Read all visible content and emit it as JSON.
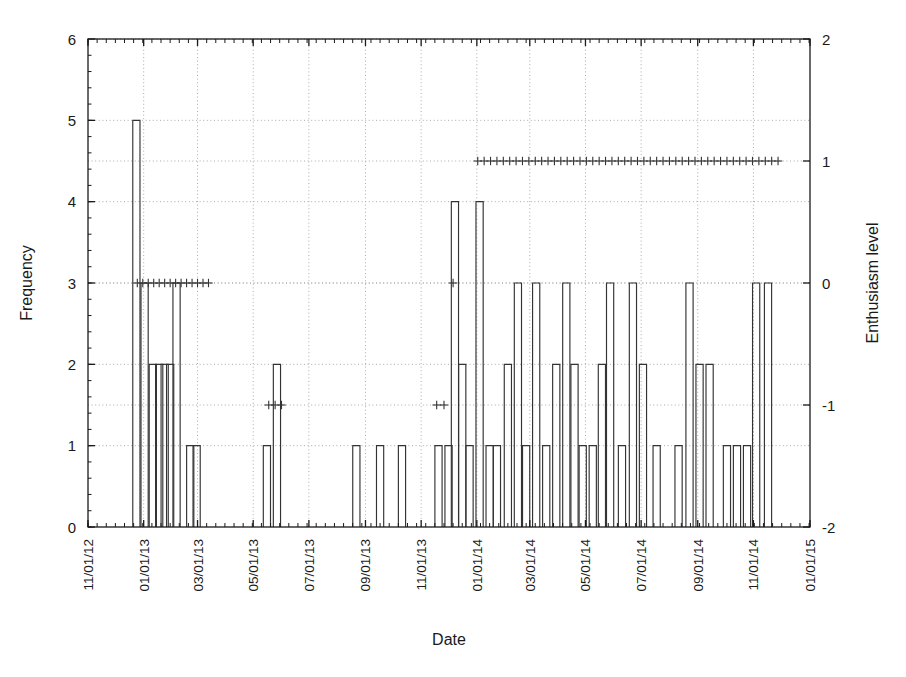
{
  "chart_data": {
    "type": "bar",
    "title": "",
    "xlabel": "Date",
    "ylabel": "Frequency",
    "y2label": "Enthusiasm level",
    "grid": true,
    "legend": null,
    "xlim": [
      "11/01/12",
      "01/01/15"
    ],
    "ylim": [
      0,
      6
    ],
    "y2lim": [
      -2,
      2
    ],
    "ytick_labels": [
      "0",
      "1",
      "2",
      "3",
      "4",
      "5",
      "6"
    ],
    "ytick_values": [
      0,
      1,
      2,
      3,
      4,
      5,
      6
    ],
    "y2tick_labels": [
      "-2",
      "-1",
      "0",
      "1",
      "2"
    ],
    "y2tick_values": [
      -2,
      -1,
      0,
      1,
      2
    ],
    "xtick_labels": [
      "11/01/12",
      "01/01/13",
      "03/01/13",
      "05/01/13",
      "07/01/13",
      "09/01/13",
      "11/01/13",
      "01/01/14",
      "03/01/14",
      "05/01/14",
      "07/01/14",
      "09/01/14",
      "11/01/14",
      "01/01/15"
    ],
    "xtick_positions": [
      0,
      61,
      120,
      181,
      242,
      304,
      365,
      426,
      484,
      545,
      606,
      668,
      729,
      791
    ],
    "x_axis_total_days": 791,
    "bar_series_name": "Frequency",
    "bars": [
      {
        "day": 53,
        "value": 5
      },
      {
        "day": 62,
        "value": 3
      },
      {
        "day": 71,
        "value": 2
      },
      {
        "day": 78,
        "value": 2
      },
      {
        "day": 84,
        "value": 2
      },
      {
        "day": 90,
        "value": 2
      },
      {
        "day": 97,
        "value": 3
      },
      {
        "day": 112,
        "value": 1
      },
      {
        "day": 119,
        "value": 1
      },
      {
        "day": 196,
        "value": 1
      },
      {
        "day": 207,
        "value": 2
      },
      {
        "day": 294,
        "value": 1
      },
      {
        "day": 320,
        "value": 1
      },
      {
        "day": 344,
        "value": 1
      },
      {
        "day": 384,
        "value": 1
      },
      {
        "day": 395,
        "value": 1
      },
      {
        "day": 402,
        "value": 4
      },
      {
        "day": 410,
        "value": 2
      },
      {
        "day": 418,
        "value": 1
      },
      {
        "day": 429,
        "value": 4
      },
      {
        "day": 440,
        "value": 1
      },
      {
        "day": 448,
        "value": 1
      },
      {
        "day": 460,
        "value": 2
      },
      {
        "day": 471,
        "value": 3
      },
      {
        "day": 480,
        "value": 1
      },
      {
        "day": 491,
        "value": 3
      },
      {
        "day": 502,
        "value": 1
      },
      {
        "day": 513,
        "value": 2
      },
      {
        "day": 524,
        "value": 3
      },
      {
        "day": 533,
        "value": 2
      },
      {
        "day": 542,
        "value": 1
      },
      {
        "day": 553,
        "value": 1
      },
      {
        "day": 563,
        "value": 2
      },
      {
        "day": 572,
        "value": 3
      },
      {
        "day": 585,
        "value": 1
      },
      {
        "day": 597,
        "value": 3
      },
      {
        "day": 608,
        "value": 2
      },
      {
        "day": 623,
        "value": 1
      },
      {
        "day": 647,
        "value": 1
      },
      {
        "day": 659,
        "value": 3
      },
      {
        "day": 670,
        "value": 2
      },
      {
        "day": 681,
        "value": 2
      },
      {
        "day": 700,
        "value": 1
      },
      {
        "day": 711,
        "value": 1
      },
      {
        "day": 722,
        "value": 1
      },
      {
        "day": 732,
        "value": 3
      },
      {
        "day": 745,
        "value": 3
      }
    ],
    "marker_series_name": "Enthusiasm level",
    "marker_symbol": "+",
    "markers": [
      {
        "day": 54,
        "value": 0
      },
      {
        "day": 60,
        "value": 0
      },
      {
        "day": 66,
        "value": 0
      },
      {
        "day": 72,
        "value": 0
      },
      {
        "day": 78,
        "value": 0
      },
      {
        "day": 84,
        "value": 0
      },
      {
        "day": 90,
        "value": 0
      },
      {
        "day": 96,
        "value": 0
      },
      {
        "day": 102,
        "value": 0
      },
      {
        "day": 108,
        "value": 0
      },
      {
        "day": 114,
        "value": 0
      },
      {
        "day": 120,
        "value": 0
      },
      {
        "day": 126,
        "value": 0
      },
      {
        "day": 132,
        "value": 0
      },
      {
        "day": 198,
        "value": -1
      },
      {
        "day": 205,
        "value": -1
      },
      {
        "day": 212,
        "value": -1
      },
      {
        "day": 382,
        "value": -1
      },
      {
        "day": 390,
        "value": -1
      },
      {
        "day": 400,
        "value": 0
      },
      {
        "day": 427,
        "value": 1
      },
      {
        "day": 434,
        "value": 1
      },
      {
        "day": 441,
        "value": 1
      },
      {
        "day": 448,
        "value": 1
      },
      {
        "day": 455,
        "value": 1
      },
      {
        "day": 462,
        "value": 1
      },
      {
        "day": 469,
        "value": 1
      },
      {
        "day": 476,
        "value": 1
      },
      {
        "day": 483,
        "value": 1
      },
      {
        "day": 490,
        "value": 1
      },
      {
        "day": 497,
        "value": 1
      },
      {
        "day": 504,
        "value": 1
      },
      {
        "day": 511,
        "value": 1
      },
      {
        "day": 518,
        "value": 1
      },
      {
        "day": 525,
        "value": 1
      },
      {
        "day": 532,
        "value": 1
      },
      {
        "day": 539,
        "value": 1
      },
      {
        "day": 546,
        "value": 1
      },
      {
        "day": 553,
        "value": 1
      },
      {
        "day": 560,
        "value": 1
      },
      {
        "day": 567,
        "value": 1
      },
      {
        "day": 574,
        "value": 1
      },
      {
        "day": 581,
        "value": 1
      },
      {
        "day": 588,
        "value": 1
      },
      {
        "day": 595,
        "value": 1
      },
      {
        "day": 602,
        "value": 1
      },
      {
        "day": 609,
        "value": 1
      },
      {
        "day": 616,
        "value": 1
      },
      {
        "day": 623,
        "value": 1
      },
      {
        "day": 630,
        "value": 1
      },
      {
        "day": 637,
        "value": 1
      },
      {
        "day": 644,
        "value": 1
      },
      {
        "day": 651,
        "value": 1
      },
      {
        "day": 658,
        "value": 1
      },
      {
        "day": 665,
        "value": 1
      },
      {
        "day": 672,
        "value": 1
      },
      {
        "day": 679,
        "value": 1
      },
      {
        "day": 686,
        "value": 1
      },
      {
        "day": 693,
        "value": 1
      },
      {
        "day": 700,
        "value": 1
      },
      {
        "day": 707,
        "value": 1
      },
      {
        "day": 714,
        "value": 1
      },
      {
        "day": 721,
        "value": 1
      },
      {
        "day": 728,
        "value": 1
      },
      {
        "day": 735,
        "value": 1
      },
      {
        "day": 742,
        "value": 1
      },
      {
        "day": 749,
        "value": 1
      },
      {
        "day": 756,
        "value": 1
      }
    ],
    "colors": {
      "line": "#333333",
      "grid": "#aaaaaa",
      "axis": "#1a1a1a",
      "background": "#ffffff"
    }
  }
}
